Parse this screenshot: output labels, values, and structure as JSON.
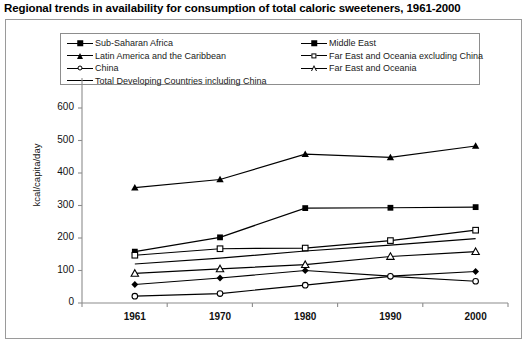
{
  "chart_data": {
    "type": "line",
    "title": "Regional trends in availability for consumption of total caloric sweeteners, 1961-2000",
    "xlabel": "",
    "ylabel": "kcal/capita/day",
    "categories": [
      "1961",
      "1970",
      "1980",
      "1990",
      "2000"
    ],
    "ylim": [
      0,
      600
    ],
    "yticks": [
      "0",
      "100",
      "200",
      "300",
      "400",
      "500",
      "600"
    ],
    "grid": false,
    "legend_position": "top-inside",
    "series": [
      {
        "name": "Sub-Saharan Africa",
        "marker": "diamond-filled",
        "values": [
          57,
          77,
          100,
          83,
          97
        ]
      },
      {
        "name": "Middle East",
        "marker": "square-filled",
        "values": [
          158,
          202,
          292,
          293,
          295
        ]
      },
      {
        "name": "Latin America and the Caribbean",
        "marker": "triangle-filled",
        "values": [
          355,
          380,
          458,
          448,
          483
        ]
      },
      {
        "name": "Far East and Oceania excluding China",
        "marker": "square-open",
        "values": [
          147,
          167,
          169,
          192,
          224
        ]
      },
      {
        "name": "China",
        "marker": "circle-open",
        "values": [
          21,
          29,
          55,
          82,
          67
        ]
      },
      {
        "name": "Far East and Oceania",
        "marker": "triangle-open",
        "values": [
          91,
          105,
          118,
          143,
          158
        ]
      },
      {
        "name": "Total Developing Countries including China",
        "marker": "none",
        "values": [
          120,
          138,
          160,
          178,
          198
        ]
      }
    ]
  },
  "legend": {
    "left_column": [
      "Sub-Saharan Africa",
      "Latin America and the Caribbean",
      "China",
      "Total Developing Countries including China"
    ],
    "right_column": [
      "Middle East",
      "Far East and Oceania excluding China",
      "Far East and Oceania"
    ]
  },
  "colors": {
    "line": "#000000",
    "frame": "#9a9a9a",
    "axis": "#8c8c8c",
    "text": "#111111"
  }
}
